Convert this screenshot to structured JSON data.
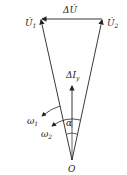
{
  "diagram": {
    "labels": {
      "delta_u": "ΔU̇",
      "u1": "U̇",
      "u1_sub": "1",
      "u2": "U̇",
      "u2_sub": "2",
      "delta_iy": "ΔİI",
      "delta_iy_main": "ΔI",
      "delta_iy_sub": "y",
      "omega1": "ω",
      "omega1_sub": "1",
      "omega2": "ω",
      "omega2_sub": "2",
      "alpha": "α",
      "origin": "O"
    },
    "colors": {
      "stroke": "#222222",
      "background": "#ffffff"
    }
  }
}
